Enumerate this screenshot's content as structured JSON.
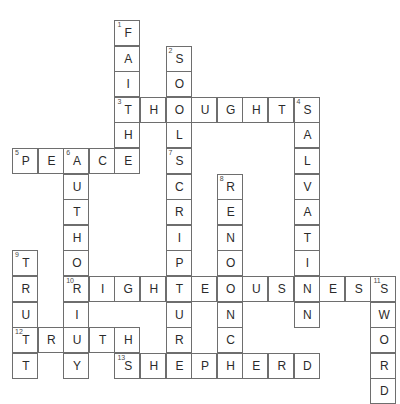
{
  "puzzle": {
    "title": "Crossword Puzzle Grid",
    "grid": {
      "cell_size": 25.6,
      "origin_x": 12,
      "origin_y": 20,
      "columns": 16,
      "rows": 16
    },
    "entries": [
      {
        "number": "1",
        "answer": "FAITH",
        "direction": "down",
        "col": 5,
        "row": 1
      },
      {
        "number": "2",
        "answer": "SOUL",
        "direction": "down",
        "col": 7,
        "row": 2
      },
      {
        "number": "3",
        "answer": "THOUGHTS",
        "direction": "across",
        "col": 5,
        "row": 4
      },
      {
        "number": "4",
        "answer": "SALVATION",
        "direction": "down",
        "col": 12,
        "row": 4
      },
      {
        "number": "5",
        "answer": "PEACE",
        "direction": "across",
        "col": 1,
        "row": 6
      },
      {
        "number": "6",
        "answer": "AUTHORITY",
        "direction": "down",
        "col": 3,
        "row": 6
      },
      {
        "number": "7",
        "answer": "SCRIPTURE",
        "direction": "down",
        "col": 7,
        "row": 6
      },
      {
        "number": "8",
        "answer": "RENOUNCE",
        "direction": "down",
        "col": 9,
        "row": 7
      },
      {
        "number": "9",
        "answer": "TRUST",
        "direction": "down",
        "col": 1,
        "row": 10
      },
      {
        "number": "10",
        "answer": "RIGHTEOUSNESS",
        "direction": "across",
        "col": 3,
        "row": 11
      },
      {
        "number": "11",
        "answer": "SWORD",
        "direction": "down",
        "col": 15,
        "row": 11
      },
      {
        "number": "12",
        "answer": "TRUTH",
        "direction": "across",
        "col": 1,
        "row": 13
      },
      {
        "number": "13",
        "answer": "SHEPHERD",
        "direction": "across",
        "col": 5,
        "row": 14
      }
    ],
    "colors": {
      "cell_border": "#6e6e6e",
      "cell_fill": "#ffffff",
      "letter": "#2b2b2b",
      "number": "#4a4a4a",
      "page_background": "#ffffff"
    }
  }
}
